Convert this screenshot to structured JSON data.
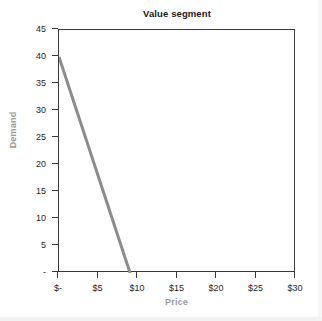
{
  "chart_data": {
    "type": "line",
    "title": "Value segment",
    "xlabel": "Price",
    "ylabel": "Demand",
    "xlim": [
      0,
      30
    ],
    "ylim": [
      0,
      45
    ],
    "grid": false,
    "legend": null,
    "x_tick_values": [
      0,
      5,
      10,
      15,
      20,
      25,
      30
    ],
    "x_tick_labels": [
      "$-",
      "$5",
      "$10",
      "$15",
      "$20",
      "$25",
      "$30"
    ],
    "y_tick_values": [
      0,
      5,
      10,
      15,
      20,
      25,
      30,
      35,
      40,
      45
    ],
    "y_tick_labels": [
      "-",
      "5",
      "10",
      "15",
      "20",
      "25",
      "30",
      "35",
      "40",
      "45"
    ],
    "series": [
      {
        "name": "Demand curve",
        "color": "#8c8c8c",
        "line_width": 3,
        "x": [
          0,
          9
        ],
        "values": [
          40,
          0
        ],
        "points": [
          {
            "x": 0,
            "y": 40
          },
          {
            "x": 9,
            "y": 0
          }
        ]
      }
    ],
    "axis_color": "#3a3a3a",
    "axis_title_color": "#9a9a9a",
    "tick_label_color": "#1f1f1f",
    "plot_background": "#ffffff"
  }
}
